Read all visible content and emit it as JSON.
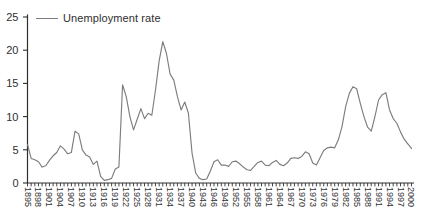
{
  "legend": {
    "label": "Unemployment rate"
  },
  "colors": {
    "line": "#7d7d7d",
    "axis": "#2f2f2f",
    "text": "#2f2f2f",
    "background": "#ffffff"
  },
  "chart_data": {
    "type": "line",
    "title": "",
    "xlabel": "",
    "ylabel": "",
    "x_range": [
      1895,
      2000
    ],
    "ylim": [
      0,
      25
    ],
    "yticks": [
      0,
      5,
      10,
      15,
      20,
      25
    ],
    "ytick_labels": [
      "0",
      "5",
      "10",
      "15",
      "20",
      "25"
    ],
    "xtick_minor_every_years": 1,
    "xtick_label_every_years": 3,
    "xtick_labels": [
      "1895",
      "1898",
      "1901",
      "1904",
      "1907",
      "1910",
      "1913",
      "1916",
      "1919",
      "1922",
      "1925",
      "1928",
      "1931",
      "1934",
      "1937",
      "1940",
      "1943",
      "1946",
      "1949",
      "1952",
      "1955",
      "1958",
      "1961",
      "1964",
      "1967",
      "1970",
      "1973",
      "1976",
      "1979",
      "1982",
      "1985",
      "1988",
      "1991",
      "1994",
      "1997",
      "2000"
    ],
    "xtick_labels_rotation_deg": 90,
    "grid": false,
    "legend_position": "top-left",
    "series": [
      {
        "name": "Unemployment rate",
        "x_start": 1895,
        "x_step": 1,
        "values": [
          5.8,
          3.7,
          3.5,
          3.2,
          2.4,
          2.6,
          3.4,
          4.1,
          4.6,
          5.6,
          5.1,
          4.4,
          4.6,
          7.8,
          7.4,
          5.0,
          4.2,
          3.9,
          2.8,
          3.3,
          1.0,
          0.4,
          0.5,
          0.7,
          2.1,
          2.4,
          14.8,
          13.0,
          10.0,
          8.0,
          9.6,
          11.2,
          9.7,
          10.5,
          10.2,
          14.0,
          18.4,
          21.3,
          19.5,
          16.4,
          15.5,
          13.0,
          11.0,
          12.2,
          10.5,
          4.5,
          1.5,
          0.7,
          0.5,
          0.6,
          1.8,
          3.2,
          3.5,
          2.7,
          2.7,
          2.5,
          3.2,
          3.3,
          2.9,
          2.4,
          2.0,
          1.9,
          2.5,
          3.1,
          3.3,
          2.7,
          2.6,
          3.1,
          3.4,
          2.8,
          2.6,
          3.0,
          3.7,
          3.8,
          3.7,
          4.0,
          4.7,
          4.4,
          3.0,
          2.7,
          3.8,
          4.9,
          5.3,
          5.4,
          5.3,
          6.5,
          8.5,
          11.5,
          13.5,
          14.5,
          14.2,
          12.0,
          10.0,
          8.4,
          7.8,
          10.0,
          12.5,
          13.3,
          13.6,
          11.0,
          9.7,
          9.0,
          7.7,
          6.6,
          5.9,
          5.2
        ]
      }
    ]
  }
}
